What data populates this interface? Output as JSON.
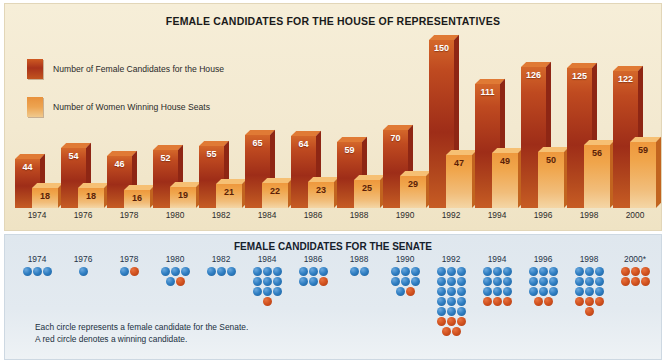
{
  "house": {
    "title": "FEMALE CANDIDATES FOR THE HOUSE OF REPRESENTATIVES",
    "legend": [
      {
        "key": "candidates",
        "label": "Number of Female Candidates for the House",
        "color": "#a8321a"
      },
      {
        "key": "winners",
        "label": "Number of Women Winning House Seats",
        "color": "#eda451"
      }
    ]
  },
  "senate": {
    "title": "FEMALE CANDIDATES FOR THE SENATE",
    "footnote_line1": "Each circle represents a female candidate for the Senate.",
    "footnote_line2": "A red circle denotes a winning candidate.",
    "legend_colors": {
      "candidate": "#2f7ec2",
      "winner": "#d2521f"
    }
  },
  "chart_data": [
    {
      "type": "bar",
      "title": "FEMALE CANDIDATES FOR THE HOUSE OF REPRESENTATIVES",
      "xlabel": "",
      "ylabel": "",
      "ylim": [
        0,
        150
      ],
      "grid": false,
      "legend_position": "top-left",
      "categories": [
        "1974",
        "1976",
        "1978",
        "1980",
        "1982",
        "1984",
        "1986",
        "1988",
        "1990",
        "1992",
        "1994",
        "1996",
        "1998",
        "2000"
      ],
      "series": [
        {
          "name": "Number of Female Candidates for the House",
          "color": "#a8321a",
          "values": [
            44,
            54,
            46,
            52,
            55,
            65,
            64,
            59,
            70,
            150,
            111,
            126,
            125,
            122
          ]
        },
        {
          "name": "Number of Women Winning House Seats",
          "color": "#eda451",
          "values": [
            18,
            18,
            16,
            19,
            21,
            22,
            23,
            25,
            29,
            47,
            49,
            50,
            56,
            59
          ]
        }
      ]
    },
    {
      "type": "table",
      "title": "FEMALE CANDIDATES FOR THE SENATE",
      "xlabel": "",
      "ylabel": "",
      "grid": false,
      "legend_position": "below",
      "categories": [
        "1974",
        "1976",
        "1978",
        "1980",
        "1982",
        "1984",
        "1986",
        "1988",
        "1990",
        "1992",
        "1994",
        "1996",
        "1998",
        "2000*"
      ],
      "series": [
        {
          "name": "Female candidates (blue circles)",
          "values": [
            3,
            1,
            2,
            4,
            3,
            9,
            5,
            2,
            7,
            15,
            9,
            9,
            9,
            0
          ]
        },
        {
          "name": "Winning candidates (red circles)",
          "values": [
            0,
            0,
            1,
            1,
            0,
            1,
            1,
            0,
            1,
            5,
            3,
            2,
            4,
            6
          ]
        },
        {
          "name": "Total candidates",
          "values": [
            3,
            1,
            3,
            5,
            3,
            10,
            6,
            2,
            8,
            20,
            12,
            11,
            13,
            6
          ]
        }
      ]
    }
  ],
  "senate_columns": [
    {
      "year": "1974",
      "rows": [
        [
          "b",
          "b",
          "b"
        ]
      ]
    },
    {
      "year": "1976",
      "rows": [
        [
          "b"
        ]
      ]
    },
    {
      "year": "1978",
      "rows": [
        [
          "b",
          "r"
        ]
      ]
    },
    {
      "year": "1980",
      "rows": [
        [
          "b",
          "b",
          "b"
        ],
        [
          "b",
          "r"
        ]
      ]
    },
    {
      "year": "1982",
      "rows": [
        [
          "b",
          "b",
          "b"
        ]
      ]
    },
    {
      "year": "1984",
      "rows": [
        [
          "b",
          "b",
          "b"
        ],
        [
          "b",
          "b",
          "b"
        ],
        [
          "b",
          "b",
          "b"
        ],
        [
          "r"
        ]
      ]
    },
    {
      "year": "1986",
      "rows": [
        [
          "b",
          "b",
          "b"
        ],
        [
          "b",
          "b",
          "r"
        ]
      ]
    },
    {
      "year": "1988",
      "rows": [
        [
          "b",
          "b"
        ]
      ]
    },
    {
      "year": "1990",
      "rows": [
        [
          "b",
          "b",
          "b"
        ],
        [
          "b",
          "b",
          "b"
        ],
        [
          "b",
          "r"
        ]
      ]
    },
    {
      "year": "1992",
      "rows": [
        [
          "b",
          "b",
          "b"
        ],
        [
          "b",
          "b",
          "b"
        ],
        [
          "b",
          "b",
          "b"
        ],
        [
          "b",
          "b",
          "b"
        ],
        [
          "b",
          "b",
          "b"
        ],
        [
          "r",
          "r",
          "r"
        ],
        [
          "r",
          "r"
        ]
      ]
    },
    {
      "year": "1994",
      "rows": [
        [
          "b",
          "b",
          "b"
        ],
        [
          "b",
          "b",
          "b"
        ],
        [
          "b",
          "b",
          "b"
        ],
        [
          "r",
          "r",
          "r"
        ]
      ]
    },
    {
      "year": "1996",
      "rows": [
        [
          "b",
          "b",
          "b"
        ],
        [
          "b",
          "b",
          "b"
        ],
        [
          "b",
          "b",
          "b"
        ],
        [
          "r",
          "r"
        ]
      ]
    },
    {
      "year": "1998",
      "rows": [
        [
          "b",
          "b",
          "b"
        ],
        [
          "b",
          "b",
          "b"
        ],
        [
          "b",
          "b",
          "b"
        ],
        [
          "r",
          "r",
          "r"
        ],
        [
          "r"
        ]
      ]
    },
    {
      "year": "2000*",
      "rows": [
        [
          "r",
          "r",
          "r"
        ],
        [
          "r",
          "r",
          "r"
        ]
      ]
    }
  ]
}
